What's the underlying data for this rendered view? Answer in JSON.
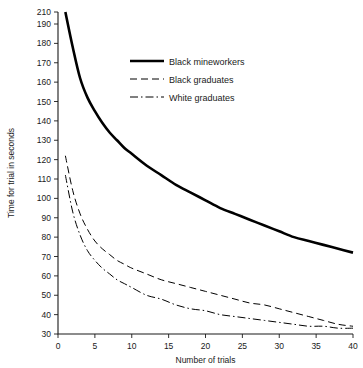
{
  "chart_data": {
    "type": "line",
    "title": "",
    "xlabel": "Number of trials",
    "ylabel": "Time for trial in seconds",
    "xlim": [
      0,
      40
    ],
    "ylim": [
      30,
      210
    ],
    "grid": false,
    "legend_position": "top-center",
    "xticks": [
      0,
      5,
      10,
      15,
      20,
      25,
      30,
      35,
      40
    ],
    "yticks": [
      30,
      40,
      50,
      60,
      70,
      80,
      90,
      100,
      110,
      120,
      130,
      140,
      150,
      160,
      170,
      180,
      190,
      210
    ],
    "y_axis_note": "190 to 210 compressed at top of scale",
    "series": [
      {
        "name": "Black mineworkers",
        "style": "solid",
        "linewidth": 2.6,
        "x": [
          1,
          2,
          3,
          4,
          5,
          6,
          7,
          8,
          9,
          10,
          12,
          14,
          16,
          18,
          20,
          22,
          24,
          26,
          28,
          30,
          32,
          34,
          36,
          38,
          40
        ],
        "values": [
          210,
          178,
          162,
          152,
          145,
          139,
          134,
          130,
          126,
          123,
          117,
          112,
          107,
          103,
          99,
          95,
          92,
          89,
          86,
          83,
          80,
          78,
          76,
          74,
          72
        ]
      },
      {
        "name": "Black graduates",
        "style": "dashed",
        "linewidth": 1.0,
        "x": [
          1,
          2,
          3,
          4,
          5,
          6,
          7,
          8,
          9,
          10,
          12,
          14,
          16,
          18,
          20,
          22,
          24,
          26,
          28,
          30,
          32,
          34,
          36,
          38,
          40
        ],
        "values": [
          122,
          104,
          92,
          84,
          78,
          74,
          71,
          68,
          66,
          64,
          61,
          58,
          56,
          54,
          52,
          50,
          48,
          46,
          45,
          43,
          41,
          39,
          37,
          35,
          34
        ]
      },
      {
        "name": "White graduates",
        "style": "dashdot",
        "linewidth": 1.0,
        "x": [
          1,
          2,
          3,
          4,
          5,
          6,
          7,
          8,
          9,
          10,
          12,
          14,
          16,
          18,
          20,
          22,
          24,
          26,
          28,
          30,
          32,
          34,
          36,
          38,
          40
        ],
        "values": [
          112,
          93,
          81,
          73,
          68,
          64,
          61,
          58,
          56,
          54,
          50,
          48,
          45,
          43,
          42,
          40,
          39,
          38,
          37,
          36,
          35,
          34,
          34,
          33,
          33
        ]
      }
    ],
    "legend": [
      {
        "label": "Black mineworkers",
        "style": "solid"
      },
      {
        "label": "Black graduates",
        "style": "dashed"
      },
      {
        "label": "White graduates",
        "style": "dashdot"
      }
    ]
  }
}
